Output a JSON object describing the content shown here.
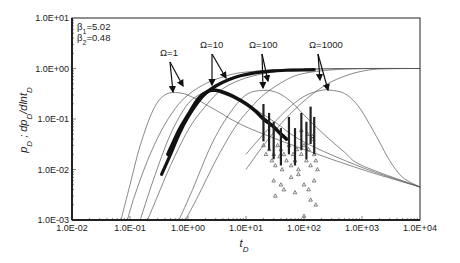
{
  "chart_data": {
    "type": "line",
    "title": "",
    "xlabel": "t_D",
    "ylabel": "p_D ; dp_D/dln t_D",
    "xscale": "log",
    "yscale": "log",
    "xlim": [
      0.01,
      10000
    ],
    "ylim": [
      0.001,
      10
    ],
    "grid": false,
    "legend": "none",
    "x_ticks": [
      "1.0E-02",
      "1.0E-01",
      "1.0E+00",
      "1.0E+01",
      "1.0E+02",
      "1.0E+03",
      "1.0E+04"
    ],
    "y_ticks": [
      "1.0E+01",
      "1.0E+00",
      "1.0E-01",
      "1.0E-02",
      "1.0E-03"
    ],
    "parameters": [
      {
        "label": "β1=5.02",
        "sym": "β",
        "sub": "1",
        "val": "=5.02"
      },
      {
        "label": "β2=0.48",
        "sym": "β",
        "sub": "2",
        "val": "=0.48"
      }
    ],
    "annotations": [
      {
        "text": "Ω=1",
        "x_px": 160,
        "y_px": 56,
        "arrow_from": [
          170,
          62
        ],
        "arrow_to": [
          [
            173,
            92
          ],
          [
            183,
            86
          ]
        ]
      },
      {
        "text": "Ω=10",
        "x_px": 200,
        "y_px": 48,
        "arrow_from": [
          212,
          54
        ],
        "arrow_to": [
          [
            212,
            85
          ],
          [
            226,
            78
          ]
        ]
      },
      {
        "text": "Ω=100",
        "x_px": 249,
        "y_px": 48,
        "arrow_from": [
          262,
          54
        ],
        "arrow_to": [
          [
            263,
            88
          ],
          [
            268,
            81
          ]
        ]
      },
      {
        "text": "Ω=1000",
        "x_px": 309,
        "y_px": 48,
        "arrow_from": [
          318,
          54
        ],
        "arrow_to": [
          [
            320,
            80
          ],
          [
            328,
            90
          ]
        ]
      }
    ],
    "series": [
      {
        "name": "Ω=1 pressure (model)",
        "kind": "model",
        "x": [
          0.09,
          0.12,
          0.2,
          0.35,
          0.6,
          1,
          2,
          4,
          10,
          100,
          10000
        ],
        "y": [
          0.001,
          0.003,
          0.015,
          0.06,
          0.16,
          0.3,
          0.5,
          0.68,
          0.85,
          0.98,
          1.0
        ]
      },
      {
        "name": "Ω=1 derivative (model)",
        "kind": "model",
        "x": [
          0.07,
          0.1,
          0.15,
          0.25,
          0.4,
          0.7,
          1.2,
          3,
          10,
          100,
          1000,
          10000
        ],
        "y": [
          0.001,
          0.005,
          0.03,
          0.15,
          0.3,
          0.33,
          0.27,
          0.15,
          0.07,
          0.025,
          0.01,
          0.0045
        ]
      },
      {
        "name": "Ω=10 pressure (model)",
        "kind": "model",
        "x": [
          0.2,
          0.3,
          0.5,
          1,
          2,
          4,
          10,
          30,
          100,
          1000,
          10000
        ],
        "y": [
          0.001,
          0.003,
          0.012,
          0.06,
          0.18,
          0.4,
          0.65,
          0.85,
          0.95,
          1.0,
          1.0
        ]
      },
      {
        "name": "Ω=10 derivative (model)",
        "kind": "model",
        "x": [
          0.15,
          0.25,
          0.5,
          1,
          2,
          3,
          5,
          10,
          30,
          100,
          1000,
          10000
        ],
        "y": [
          0.001,
          0.006,
          0.05,
          0.2,
          0.35,
          0.38,
          0.33,
          0.2,
          0.09,
          0.035,
          0.011,
          0.0045
        ]
      },
      {
        "name": "Ω=100 pressure (model)",
        "kind": "model",
        "x": [
          0.9,
          1.5,
          3,
          6,
          10,
          20,
          50,
          100,
          300,
          1000,
          10000
        ],
        "y": [
          0.001,
          0.003,
          0.015,
          0.06,
          0.13,
          0.3,
          0.6,
          0.8,
          0.94,
          0.99,
          1.0
        ]
      },
      {
        "name": "Ω=100 derivative (model)",
        "kind": "model",
        "x": [
          0.7,
          1.2,
          2.5,
          5,
          10,
          20,
          35,
          60,
          100,
          200,
          500,
          1000,
          10000
        ],
        "y": [
          0.001,
          0.004,
          0.03,
          0.12,
          0.3,
          0.37,
          0.33,
          0.22,
          0.12,
          0.055,
          0.022,
          0.012,
          0.0045
        ]
      },
      {
        "name": "Ω=1000 pressure (model)",
        "kind": "model",
        "x": [
          10,
          20,
          40,
          80,
          150,
          300,
          700,
          1500,
          3000,
          10000
        ],
        "y": [
          0.01,
          0.03,
          0.08,
          0.18,
          0.33,
          0.55,
          0.8,
          0.95,
          0.99,
          1.0
        ]
      },
      {
        "name": "Ω=1000 derivative (model)",
        "kind": "model",
        "x": [
          10,
          20,
          50,
          100,
          200,
          300,
          500,
          800,
          1200,
          2000,
          3000,
          5000,
          10000
        ],
        "y": [
          0.02,
          0.05,
          0.15,
          0.28,
          0.37,
          0.37,
          0.32,
          0.2,
          0.1,
          0.035,
          0.015,
          0.007,
          0.0045
        ]
      },
      {
        "name": "Pressure (field data)",
        "kind": "data",
        "x": [
          0.35,
          0.5,
          0.7,
          1,
          1.5,
          2,
          3,
          5,
          8,
          15,
          30,
          60,
          100,
          150
        ],
        "y": [
          0.008,
          0.02,
          0.05,
          0.11,
          0.22,
          0.32,
          0.45,
          0.6,
          0.72,
          0.83,
          0.9,
          0.93,
          0.94,
          0.95
        ]
      },
      {
        "name": "Derivative (field data)",
        "kind": "data",
        "x": [
          0.45,
          0.7,
          1,
          1.5,
          2,
          2.5,
          3,
          4,
          6,
          10,
          15,
          20,
          30,
          40,
          50
        ],
        "y": [
          0.02,
          0.06,
          0.12,
          0.25,
          0.33,
          0.37,
          0.37,
          0.34,
          0.28,
          0.2,
          0.14,
          0.1,
          0.07,
          0.05,
          0.04
        ]
      },
      {
        "name": "Derivative scatter (noisy late data)",
        "kind": "scatter",
        "x": [
          20,
          22,
          25,
          28,
          30,
          32,
          35,
          38,
          40,
          42,
          45,
          50,
          55,
          60,
          65,
          70,
          75,
          80,
          90,
          100,
          110,
          120,
          130,
          140,
          150,
          160,
          170,
          30,
          40,
          60,
          80,
          100,
          120,
          150,
          32,
          45,
          70,
          100,
          130,
          160,
          90,
          115,
          140
        ],
        "y": [
          0.03,
          0.02,
          0.025,
          0.015,
          0.02,
          0.012,
          0.03,
          0.018,
          0.025,
          0.01,
          0.02,
          0.015,
          0.03,
          0.012,
          0.02,
          0.015,
          0.025,
          0.01,
          0.02,
          0.03,
          0.015,
          0.025,
          0.012,
          0.04,
          0.02,
          0.015,
          0.01,
          0.006,
          0.005,
          0.007,
          0.008,
          0.005,
          0.004,
          0.006,
          0.003,
          0.004,
          0.0035,
          0.0012,
          0.0025,
          0.002,
          0.06,
          0.05,
          0.045
        ]
      }
    ]
  }
}
